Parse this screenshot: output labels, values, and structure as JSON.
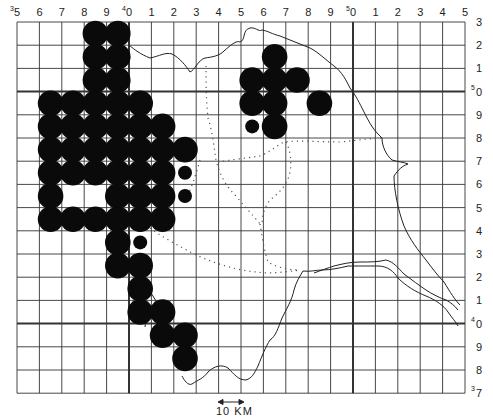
{
  "map": {
    "type": "distribution grid map",
    "grid": {
      "left": 17,
      "top": 22,
      "cell_w": 22.4,
      "cell_h": 23.2,
      "cols": 20,
      "rows": 16,
      "heavy_col_indices": [
        5,
        15
      ],
      "heavy_row_indices": [
        3,
        13
      ],
      "line_color": "#333333"
    },
    "top_labels": [
      {
        "text": "5",
        "sup": "3"
      },
      {
        "text": "6"
      },
      {
        "text": "7"
      },
      {
        "text": "8"
      },
      {
        "text": "9"
      },
      {
        "text": "0",
        "sup": "4"
      },
      {
        "text": "1"
      },
      {
        "text": "2"
      },
      {
        "text": "3"
      },
      {
        "text": "4"
      },
      {
        "text": "5"
      },
      {
        "text": "6"
      },
      {
        "text": "7"
      },
      {
        "text": "8"
      },
      {
        "text": "9"
      },
      {
        "text": "0",
        "sup": "5"
      },
      {
        "text": "1"
      },
      {
        "text": "2"
      },
      {
        "text": "3"
      },
      {
        "text": "4"
      },
      {
        "text": "5"
      }
    ],
    "right_labels": [
      {
        "text": "3"
      },
      {
        "text": "2"
      },
      {
        "text": "1"
      },
      {
        "text": "0",
        "sup": "5"
      },
      {
        "text": "9"
      },
      {
        "text": "8"
      },
      {
        "text": "7"
      },
      {
        "text": "6"
      },
      {
        "text": "5"
      },
      {
        "text": "4"
      },
      {
        "text": "3"
      },
      {
        "text": "2"
      },
      {
        "text": "1"
      },
      {
        "text": "0",
        "sup": "4"
      },
      {
        "text": "9"
      },
      {
        "text": "8"
      },
      {
        "text": "7",
        "sup": "3"
      }
    ],
    "records": {
      "large": [
        [
          3,
          0
        ],
        [
          4,
          0
        ],
        [
          3,
          1
        ],
        [
          4,
          1
        ],
        [
          3,
          2
        ],
        [
          4,
          2
        ],
        [
          1,
          3
        ],
        [
          2,
          3
        ],
        [
          3,
          3
        ],
        [
          4,
          3
        ],
        [
          5,
          3
        ],
        [
          1,
          4
        ],
        [
          2,
          4
        ],
        [
          3,
          4
        ],
        [
          4,
          4
        ],
        [
          5,
          4
        ],
        [
          6,
          4
        ],
        [
          1,
          5
        ],
        [
          2,
          5
        ],
        [
          3,
          5
        ],
        [
          4,
          5
        ],
        [
          5,
          5
        ],
        [
          6,
          5
        ],
        [
          7,
          5
        ],
        [
          1,
          6
        ],
        [
          2,
          6
        ],
        [
          3,
          6
        ],
        [
          4,
          6
        ],
        [
          5,
          6
        ],
        [
          6,
          6
        ],
        [
          1,
          7
        ],
        [
          4,
          7
        ],
        [
          5,
          7
        ],
        [
          6,
          7
        ],
        [
          1,
          8
        ],
        [
          2,
          8
        ],
        [
          3,
          8
        ],
        [
          4,
          8
        ],
        [
          5,
          8
        ],
        [
          6,
          8
        ],
        [
          4,
          9
        ],
        [
          4,
          10
        ],
        [
          5,
          10
        ],
        [
          5,
          11
        ],
        [
          5,
          12
        ],
        [
          6,
          12
        ],
        [
          6,
          13
        ],
        [
          7,
          13
        ],
        [
          7,
          14
        ],
        [
          11,
          1
        ],
        [
          10,
          2
        ],
        [
          11,
          2
        ],
        [
          12,
          2
        ],
        [
          10,
          3
        ],
        [
          11,
          3
        ],
        [
          13,
          3
        ],
        [
          11,
          4
        ]
      ],
      "small": [
        [
          7,
          6
        ],
        [
          7,
          7
        ],
        [
          5,
          9
        ],
        [
          10,
          4
        ]
      ]
    },
    "legend": {
      "scale_label": "10 KM",
      "scale_icon": "double-arrow-icon"
    },
    "colors": {
      "dot": "#0a0a0a",
      "coast": "#222222",
      "boundary": "#555555",
      "background": "#ffffff"
    }
  }
}
